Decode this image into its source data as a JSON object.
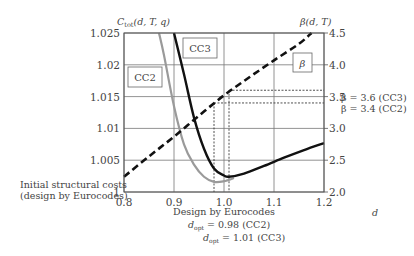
{
  "chart_data": {
    "type": "line",
    "title": "",
    "xlabel": "d",
    "ylabel_left": "C_tot(d, T, q)",
    "ylabel_right": "β(d, T)",
    "xlim": [
      0.8,
      1.2
    ],
    "ylim_left": [
      1.0,
      1.025
    ],
    "ylim_right": [
      2.0,
      4.5
    ],
    "grid": true,
    "x_ticks": [
      "0.8",
      "0.9",
      "1.0",
      "1.1",
      "1.2"
    ],
    "y_left_ticks": [
      "1",
      "1.005",
      "1.01",
      "1.015",
      "1.02",
      "1.025"
    ],
    "y_right_ticks": [
      "2.0",
      "2.5",
      "3.0",
      "3.5",
      "4.0",
      "4.5"
    ],
    "series": [
      {
        "name": "CC2",
        "axis": "left",
        "style": "solid-gray",
        "x": [
          0.87,
          0.88,
          0.9,
          0.92,
          0.94,
          0.96,
          0.98,
          1.0,
          1.02
        ],
        "y": [
          1.025,
          1.0215,
          1.0135,
          1.0075,
          1.0043,
          1.0024,
          1.0016,
          1.0017,
          1.0022
        ]
      },
      {
        "name": "CC3",
        "axis": "left",
        "style": "solid-black",
        "x": [
          0.9,
          0.92,
          0.94,
          0.96,
          0.98,
          1.0,
          1.01,
          1.04,
          1.08,
          1.12,
          1.16,
          1.2
        ],
        "y": [
          1.025,
          1.0185,
          1.0117,
          1.0068,
          1.0037,
          1.0026,
          1.0024,
          1.0029,
          1.0041,
          1.0054,
          1.0066,
          1.0077
        ]
      },
      {
        "name": "β",
        "axis": "right",
        "style": "dashed-black",
        "x": [
          0.8,
          0.85,
          0.9,
          0.95,
          1.0,
          1.05,
          1.1,
          1.15,
          1.175
        ],
        "y": [
          2.24,
          2.56,
          2.87,
          3.2,
          3.52,
          3.8,
          4.07,
          4.33,
          4.5
        ]
      }
    ],
    "reference_lines": {
      "d_opt": [
        {
          "x": 0.98,
          "beta": 3.4,
          "label": "CC2"
        },
        {
          "x": 1.01,
          "beta": 3.6,
          "label": "CC3"
        }
      ]
    },
    "annotations": {
      "box_cc2": "CC2",
      "box_cc3": "CC3",
      "box_beta": "β",
      "beta_cc3": "β = 3.6 (CC3)",
      "beta_cc2": "β = 3.4 (CC2)",
      "initial_costs_1": "Initial structural costs",
      "initial_costs_2": "(design by Eurocodes)",
      "design_by": "Design by Eurocodes",
      "dopt_cc2_value": " = 0.98 (CC2)",
      "dopt_cc3_value": " = 1.01 (CC3)",
      "dopt_prefix": "d",
      "dopt_sub": "opt",
      "ctot_prefix": "C",
      "ctot_sub": "tot",
      "ctot_args": "(d, T, q)"
    }
  }
}
